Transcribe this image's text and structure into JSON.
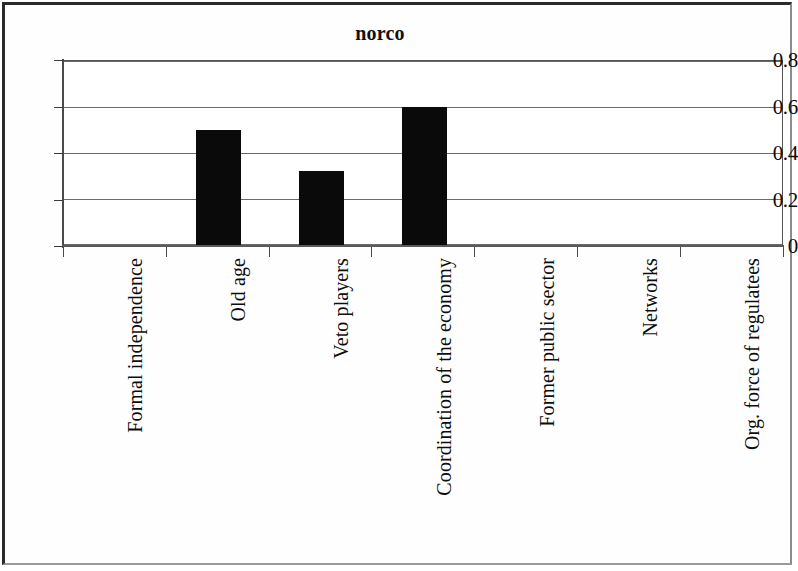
{
  "chart_data": {
    "type": "bar",
    "title": "norco",
    "xlabel": "",
    "ylabel": "",
    "categories": [
      "Formal independence",
      "Old age",
      "Veto players",
      "Coordination of the economy",
      "Former public sector",
      "Networks",
      "Org. force of regulatees"
    ],
    "values": [
      0,
      0.5,
      0.32,
      0.6,
      0,
      0,
      0
    ],
    "ylim": [
      0,
      0.8
    ],
    "yticks": [
      0,
      0.2,
      0.4,
      0.6,
      0.8
    ],
    "ytick_labels": [
      "0",
      "0.2",
      "0.4",
      "0.6",
      "0.8"
    ],
    "grid": true,
    "legend": false,
    "bar_color": "#0a0a0a",
    "background_color": "#ffffff"
  }
}
